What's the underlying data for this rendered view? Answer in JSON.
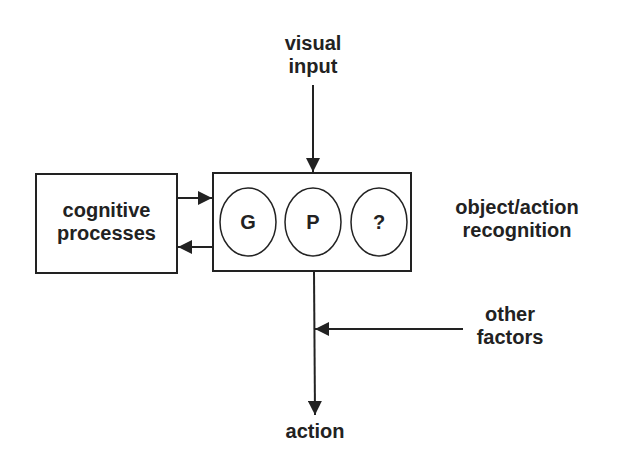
{
  "diagram": {
    "nodes": {
      "visual_input": {
        "line1": "visual",
        "line2": "input"
      },
      "cognitive_processes": {
        "line1": "cognitive",
        "line2": "processes"
      },
      "recognition_box": {
        "circles": [
          "G",
          "P",
          "?"
        ]
      },
      "recognition_label": {
        "line1": "object/action",
        "line2": "recognition"
      },
      "other_factors": {
        "line1": "other",
        "line2": "factors"
      },
      "action": {
        "label": "action"
      }
    },
    "edges": [
      {
        "from": "visual input",
        "to": "object/action recognition"
      },
      {
        "from": "cognitive processes",
        "to": "object/action recognition"
      },
      {
        "from": "object/action recognition",
        "to": "cognitive processes"
      },
      {
        "from": "object/action recognition",
        "to": "action"
      },
      {
        "from": "other factors",
        "to": "action"
      }
    ],
    "colors": {
      "stroke": "#222222",
      "background": "#ffffff"
    }
  }
}
